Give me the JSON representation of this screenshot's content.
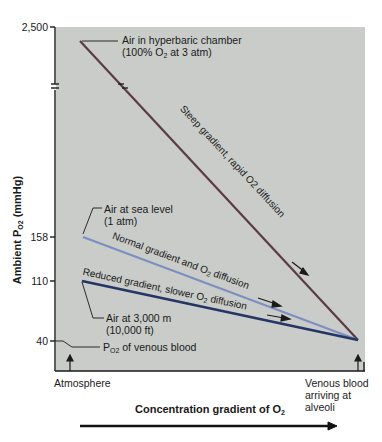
{
  "diagram": {
    "y_axis": {
      "label": "Ambient P",
      "label_sub": "O2",
      "label_unit": " (mmHg)",
      "ticks": [
        "2,500",
        "158",
        "110",
        "40"
      ]
    },
    "x_axis": {
      "left_label": "Atmosphere",
      "right_label_lines": [
        "Venous blood",
        "arriving at",
        "alveoli"
      ],
      "caption": "Concentration gradient of O",
      "caption_sub": "2"
    },
    "callouts": {
      "hyperbaric_line1": "Air in hyperbaric chamber",
      "hyperbaric_line2_pre": "(100% O",
      "hyperbaric_line2_sub": "2",
      "hyperbaric_line2_post": " at 3 atm)",
      "sea_level_line1": "Air at sea level",
      "sea_level_line2": "(1 atm)",
      "altitude_line1": "Air at 3,000 m",
      "altitude_line2": "(10,000 ft)",
      "venous_pre": "P",
      "venous_sub": "O2",
      "venous_post": " of venous blood"
    },
    "gradients": {
      "steep": "Steep gradient, rapid O2 diffusion",
      "normal_pre": "Normal gradient and O",
      "normal_sub": "2",
      "normal_post": " diffusion",
      "reduced_pre": "Reduced gradient, slower O",
      "reduced_sub": "2",
      "reduced_post": " diffusion"
    },
    "colors": {
      "panel": "#c9ccc9",
      "steep_line": "#5a3c42",
      "normal_line": "#7d8fc2",
      "reduced_line": "#253566"
    }
  }
}
